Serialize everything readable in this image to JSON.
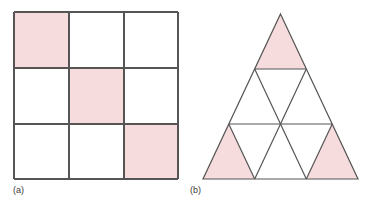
{
  "figure": {
    "canvas": {
      "width": 386,
      "height": 207,
      "background": "#ffffff"
    },
    "stroke_color": "#555555",
    "stroke_width": 1.2,
    "shaded_color": "#f6dcdc",
    "unshaded_color": "#ffffff",
    "panels": [
      {
        "id": "a",
        "label": "(a)",
        "kind": "square-grid",
        "description": "3 by 3 square grid with three shaded cells on the main diagonal",
        "rows": 3,
        "cols": 3,
        "bounds": {
          "x": 14,
          "y": 12,
          "width": 164,
          "height": 167
        },
        "cells": [
          {
            "row": 0,
            "col": 0,
            "shaded": true
          },
          {
            "row": 0,
            "col": 1,
            "shaded": false
          },
          {
            "row": 0,
            "col": 2,
            "shaded": false
          },
          {
            "row": 1,
            "col": 0,
            "shaded": false
          },
          {
            "row": 1,
            "col": 1,
            "shaded": true
          },
          {
            "row": 1,
            "col": 2,
            "shaded": false
          },
          {
            "row": 2,
            "col": 0,
            "shaded": false
          },
          {
            "row": 2,
            "col": 1,
            "shaded": false
          },
          {
            "row": 2,
            "col": 2,
            "shaded": true
          }
        ],
        "shaded_count": 3,
        "total_count": 9
      },
      {
        "id": "b",
        "label": "(b)",
        "kind": "triangle-subdivision",
        "description": "Equilateral triangle subdivided into 9 small triangles in 3 rows; apex and two bottom corner triangles shaded",
        "rows": 3,
        "apex": {
          "x": 280.5,
          "y": 14
        },
        "bottom_left": {
          "x": 203,
          "y": 179
        },
        "bottom_right": {
          "x": 358,
          "y": 179
        },
        "triangles": [
          {
            "row": 0,
            "index": 0,
            "orientation": "up",
            "shaded": true
          },
          {
            "row": 1,
            "index": 0,
            "orientation": "up",
            "shaded": false
          },
          {
            "row": 1,
            "index": 1,
            "orientation": "down",
            "shaded": false
          },
          {
            "row": 1,
            "index": 2,
            "orientation": "up",
            "shaded": false
          },
          {
            "row": 2,
            "index": 0,
            "orientation": "up",
            "shaded": true
          },
          {
            "row": 2,
            "index": 1,
            "orientation": "down",
            "shaded": false
          },
          {
            "row": 2,
            "index": 2,
            "orientation": "up",
            "shaded": false
          },
          {
            "row": 2,
            "index": 3,
            "orientation": "down",
            "shaded": false
          },
          {
            "row": 2,
            "index": 4,
            "orientation": "up",
            "shaded": true
          }
        ],
        "shaded_count": 3,
        "total_count": 9
      }
    ]
  }
}
